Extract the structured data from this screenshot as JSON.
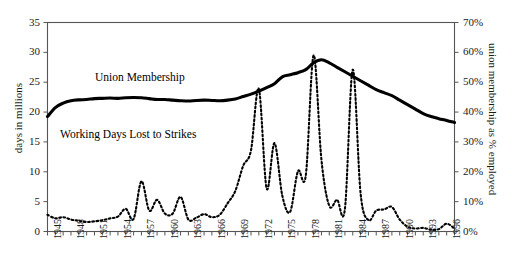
{
  "chart_data": {
    "type": "line",
    "title": "",
    "xlabel": "",
    "grid": false,
    "legend_position": "inline-annotations",
    "x": [
      1945,
      1946,
      1947,
      1948,
      1949,
      1950,
      1951,
      1952,
      1953,
      1954,
      1955,
      1956,
      1957,
      1958,
      1959,
      1960,
      1961,
      1962,
      1963,
      1964,
      1965,
      1966,
      1967,
      1968,
      1969,
      1970,
      1971,
      1972,
      1973,
      1974,
      1975,
      1976,
      1977,
      1978,
      1979,
      1980,
      1981,
      1982,
      1983,
      1984,
      1985,
      1986,
      1987,
      1988,
      1989,
      1990,
      1991,
      1992,
      1993,
      1994,
      1995,
      1996,
      1997
    ],
    "xlim": [
      1945,
      1997
    ],
    "xticks": [
      1945,
      1948,
      1951,
      1954,
      1957,
      1960,
      1963,
      1966,
      1969,
      1972,
      1975,
      1978,
      1981,
      1984,
      1987,
      1990,
      1993,
      1996
    ],
    "axes": [
      {
        "id": "left",
        "label": "days in millions",
        "ylim": [
          0,
          35
        ],
        "yticks": [
          0,
          5,
          10,
          15,
          20,
          25,
          30,
          35
        ],
        "ticklabels": [
          "0",
          "5",
          "10",
          "15",
          "20",
          "25",
          "30",
          "35"
        ]
      },
      {
        "id": "right",
        "label": "union membership as % employed",
        "ylim": [
          0,
          70
        ],
        "yticks": [
          0,
          10,
          20,
          30,
          40,
          50,
          60,
          70
        ],
        "ticklabels": [
          "0%",
          "10%",
          "20%",
          "30%",
          "40%",
          "50%",
          "60%",
          "70%"
        ]
      }
    ],
    "series": [
      {
        "name": "Union Membership",
        "axis": "right",
        "unit": "% employed",
        "style": "solid",
        "annotation": "Union Membership",
        "values": [
          38.5,
          41.5,
          43.0,
          43.8,
          44.1,
          44.2,
          44.5,
          44.6,
          44.7,
          44.6,
          44.8,
          44.9,
          44.8,
          44.5,
          44.2,
          44.2,
          44.0,
          43.8,
          43.7,
          43.9,
          44.0,
          43.9,
          43.8,
          44.0,
          44.4,
          45.2,
          46.0,
          47.0,
          48.2,
          49.5,
          51.8,
          52.5,
          53.2,
          54.2,
          56.5,
          57.5,
          56.5,
          55.0,
          53.5,
          52.0,
          50.5,
          49.0,
          47.5,
          46.5,
          45.5,
          44.0,
          42.5,
          41.0,
          39.5,
          38.5,
          37.8,
          37.2,
          36.5
        ]
      },
      {
        "name": "Working Days Lost to Strikes",
        "axis": "left",
        "unit": "days in millions",
        "style": "dashed",
        "annotation": "Working Days Lost to Strikes",
        "values": [
          2.8,
          2.2,
          2.4,
          2.0,
          1.8,
          1.6,
          1.7,
          1.9,
          2.2,
          2.5,
          3.8,
          2.1,
          8.4,
          3.5,
          5.3,
          3.0,
          3.0,
          5.8,
          2.0,
          2.3,
          2.9,
          2.4,
          2.8,
          4.7,
          6.8,
          11.0,
          13.6,
          23.9,
          7.2,
          14.8,
          6.0,
          3.3,
          10.1,
          9.4,
          29.5,
          12.0,
          4.3,
          5.3,
          3.8,
          27.1,
          6.4,
          1.9,
          3.5,
          3.7,
          4.1,
          2.0,
          0.8,
          0.5,
          0.6,
          0.3,
          0.4,
          1.3,
          0.5
        ]
      }
    ]
  }
}
